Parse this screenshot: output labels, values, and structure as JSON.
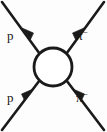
{
  "diagram": {
    "type": "feynman-scattering-diagram",
    "background_color": "#fdfdfd",
    "line_color": "#1a1a1a",
    "blob": {
      "name": "interaction-blob",
      "center_x": 53,
      "center_y": 67,
      "radius": 19,
      "fill": "#ffffff"
    },
    "legs": [
      {
        "id": "outgoing-proton",
        "position": "top-left",
        "label": "p",
        "superscript": "",
        "direction": "outgoing",
        "arrow_direction": "up-left"
      },
      {
        "id": "outgoing-pion",
        "position": "top-right",
        "label": "π",
        "superscript": "−",
        "direction": "outgoing",
        "arrow_direction": "up-right"
      },
      {
        "id": "incoming-proton",
        "position": "bottom-left",
        "label": "p",
        "superscript": "",
        "direction": "incoming",
        "arrow_direction": "up-right"
      },
      {
        "id": "incoming-pion",
        "position": "bottom-right",
        "label": "π",
        "superscript": "−",
        "direction": "incoming",
        "arrow_direction": "up-left"
      }
    ]
  }
}
